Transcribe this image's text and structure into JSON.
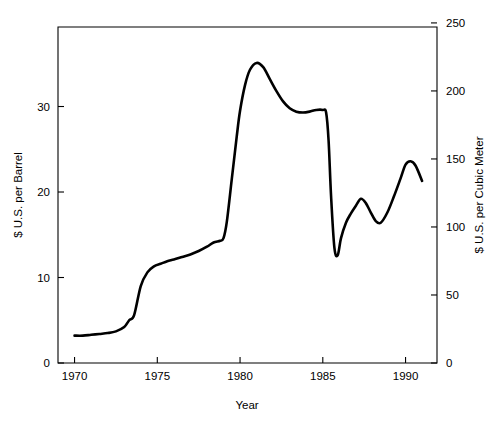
{
  "chart_data": {
    "type": "line",
    "title": "",
    "xlabel": "Year",
    "ylabel": "$ U.S. per Barrel",
    "ylabel_right": "$ U.S. per Cubic Meter",
    "xlim": [
      1969.0,
      1991.9
    ],
    "ylim": [
      0,
      39.3
    ],
    "ylim_right": [
      0,
      247
    ],
    "grid": false,
    "legend": null,
    "xticks": [
      1970,
      1975,
      1980,
      1985,
      1990
    ],
    "xtick_labels": [
      "1970",
      "1975",
      "1980",
      "1985",
      "1990"
    ],
    "yticks": [
      0,
      10,
      20,
      30
    ],
    "ytick_labels": [
      "0",
      "10",
      "20",
      "30"
    ],
    "yticks_right": [
      0,
      50,
      100,
      150,
      200,
      250
    ],
    "ytick_labels_right": [
      "0",
      "50",
      "100",
      "150",
      "200",
      "250"
    ],
    "line_color": "#000000",
    "series": [
      {
        "name": "Crude oil price",
        "x": [
          1970.0,
          1970.5,
          1971.0,
          1971.5,
          1972.0,
          1972.5,
          1973.0,
          1973.3,
          1973.6,
          1974.0,
          1974.4,
          1974.8,
          1975.2,
          1975.6,
          1976.0,
          1976.5,
          1977.0,
          1977.5,
          1978.0,
          1978.4,
          1978.8,
          1979.0,
          1979.2,
          1979.5,
          1979.8,
          1980.0,
          1980.3,
          1980.6,
          1981.0,
          1981.4,
          1981.8,
          1982.2,
          1982.6,
          1983.0,
          1983.4,
          1983.8,
          1984.2,
          1984.6,
          1985.0,
          1985.2,
          1985.35,
          1985.5,
          1985.7,
          1985.9,
          1986.1,
          1986.4,
          1986.7,
          1987.0,
          1987.3,
          1987.6,
          1987.9,
          1988.2,
          1988.5,
          1988.9,
          1989.3,
          1989.7,
          1990.0,
          1990.3,
          1990.6,
          1991.0
        ],
        "y": [
          3.2,
          3.2,
          3.3,
          3.4,
          3.5,
          3.7,
          4.2,
          5.0,
          5.6,
          9.0,
          10.6,
          11.3,
          11.6,
          11.9,
          12.1,
          12.4,
          12.7,
          13.1,
          13.6,
          14.1,
          14.3,
          14.6,
          16.5,
          21.5,
          26.5,
          29.5,
          32.5,
          34.3,
          35.1,
          34.6,
          33.2,
          31.8,
          30.6,
          29.8,
          29.4,
          29.3,
          29.4,
          29.6,
          29.6,
          29.3,
          26.0,
          19.5,
          13.5,
          12.6,
          14.6,
          16.4,
          17.5,
          18.4,
          19.2,
          18.7,
          17.6,
          16.6,
          16.4,
          17.6,
          19.5,
          21.6,
          23.2,
          23.6,
          23.1,
          21.3
        ]
      }
    ]
  },
  "axes": {
    "left_label": "$ U.S. per Barrel",
    "right_label": "$ U.S. per Cubic Meter",
    "bottom_label": "Year"
  }
}
